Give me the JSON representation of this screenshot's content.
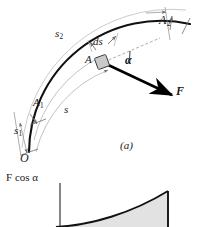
{
  "figure": {
    "panel_a": {
      "caption": "(a)",
      "origin_label": "O",
      "point_start_label": "A",
      "point_start_sub": "1",
      "point_end_label": "A",
      "point_end_sub": "2",
      "particle_label": "A",
      "arc_s1_label": "s",
      "arc_s1_sub": "1",
      "arc_s2_label": "s",
      "arc_s2_sub": "2",
      "arc_s_label": "s",
      "element_label": "ds",
      "angle_label": "α",
      "force_label": "F"
    },
    "panel_b": {
      "yaxis_label_force": "F",
      "yaxis_label_cos": "cos",
      "yaxis_label_angle": "α"
    },
    "colors": {
      "curve": "#111111",
      "guide": "#9a9a9a",
      "dimension": "#6f6f6f",
      "force_arrow": "#000000",
      "particle_fill": "#c9c9c9",
      "area_fill": "#e2e2e2",
      "text": "#1a1a1a",
      "background": "#ffffff"
    }
  }
}
